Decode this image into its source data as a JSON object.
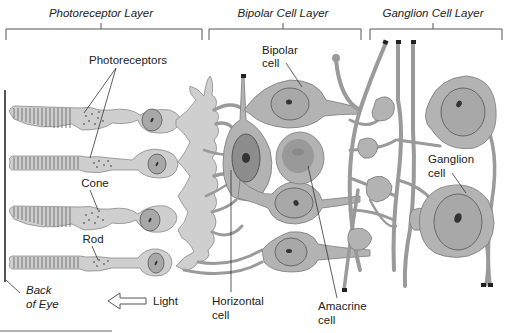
{
  "layers": [
    {
      "label": "Photoreceptor Layer"
    },
    {
      "label": "Bipolar Cell Layer"
    },
    {
      "label": "Ganglion Cell Layer"
    }
  ],
  "labels": {
    "photoreceptors": "Photoreceptors",
    "cone": "Cone",
    "rod": "Rod",
    "back_of_eye_line1": "Back",
    "back_of_eye_line2": "of Eye",
    "light": "Light",
    "horizontal_line1": "Horizontal",
    "horizontal_line2": "cell",
    "amacrine_line1": "Amacrine",
    "amacrine_line2": "cell",
    "bipolar_line1": "Bipolar",
    "bipolar_line2": "cell",
    "ganglion_line1": "Ganglion",
    "ganglion_line2": "cell"
  },
  "colors": {
    "cell_fill": "#b3b3b3",
    "photoreceptor_fill": "#cfcfcf",
    "nucleus_fill": "#a8a8a8",
    "text": "#222222",
    "bracket": "#555555"
  }
}
